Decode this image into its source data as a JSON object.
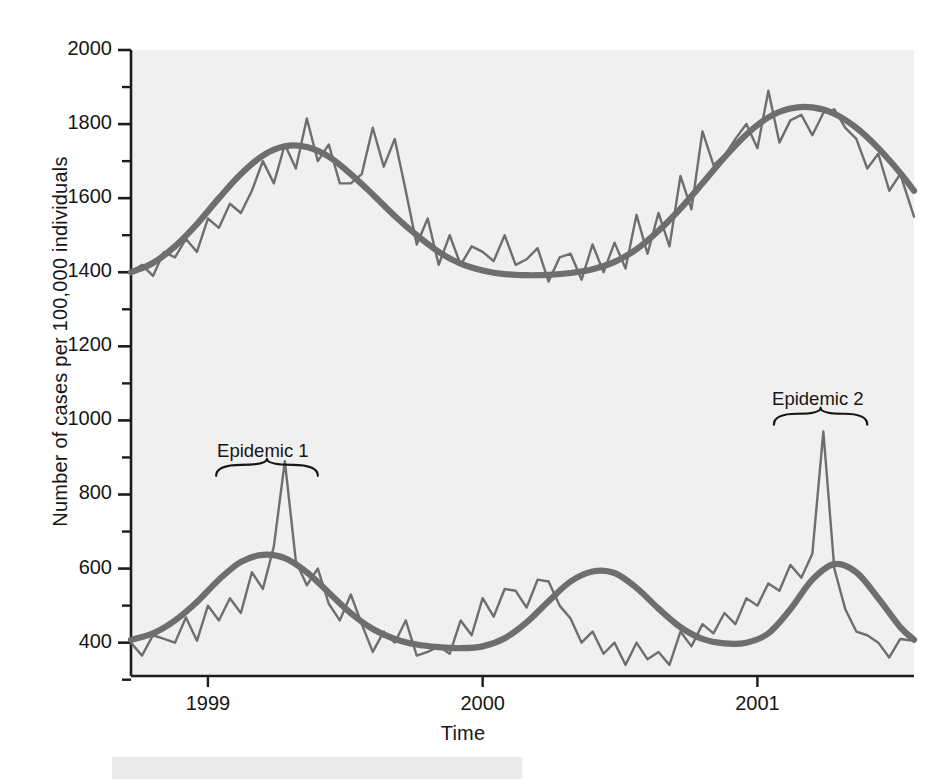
{
  "figure": {
    "background_color": "#ffffff",
    "plot_background_color": "#f0f0f0",
    "line_color": "#6e6e6e",
    "axis_color": "#1c1c1c",
    "text_color": "#161616"
  },
  "chart_data": {
    "type": "line",
    "title": "",
    "xlabel": "Time",
    "ylabel": "Number of cases per 100,000 individuals",
    "xlim": [
      1998.72,
      2001.57
    ],
    "ylim": [
      310,
      2000
    ],
    "grid": false,
    "legend": null,
    "y_major_ticks": [
      400,
      600,
      800,
      1000,
      1200,
      1400,
      1600,
      1800,
      2000
    ],
    "y_minor_ticks": [
      300,
      500,
      700,
      900,
      1100,
      1300,
      1500,
      1700,
      1900
    ],
    "y_tick_labels": [
      "400",
      "600",
      "800",
      "1000",
      "1200",
      "1400",
      "1600",
      "1800",
      "2000"
    ],
    "x_ticks": [
      1999,
      2000,
      2001
    ],
    "x_tick_labels": [
      "1999",
      "2000",
      "2001"
    ],
    "annotations": [
      {
        "label": "Epidemic 1",
        "x": 1999.2,
        "y_text": 915,
        "brace_left": 1999.03,
        "brace_right": 1999.4,
        "brace_y": 880
      },
      {
        "label": "Epidemic 2",
        "x": 2001.22,
        "y_text": 1055,
        "brace_left": 2001.06,
        "brace_right": 2001.4,
        "brace_y": 1018
      }
    ],
    "series": [
      {
        "name": "upper-observed",
        "role": "noisy-observed",
        "style": "thin-line",
        "x": [
          1998.72,
          1998.76,
          1998.8,
          1998.84,
          1998.88,
          1998.92,
          1998.96,
          1999.0,
          1999.04,
          1999.08,
          1999.12,
          1999.16,
          1999.2,
          1999.24,
          1999.28,
          1999.32,
          1999.36,
          1999.4,
          1999.44,
          1999.48,
          1999.52,
          1999.56,
          1999.6,
          1999.64,
          1999.68,
          1999.72,
          1999.76,
          1999.8,
          1999.84,
          1999.88,
          1999.92,
          1999.96,
          2000.0,
          2000.04,
          2000.08,
          2000.12,
          2000.16,
          2000.2,
          2000.24,
          2000.28,
          2000.32,
          2000.36,
          2000.4,
          2000.44,
          2000.48,
          2000.52,
          2000.56,
          2000.6,
          2000.64,
          2000.68,
          2000.72,
          2000.76,
          2000.8,
          2000.84,
          2000.88,
          2000.92,
          2000.96,
          2001.0,
          2001.04,
          2001.08,
          2001.12,
          2001.16,
          2001.2,
          2001.24,
          2001.28,
          2001.32,
          2001.36,
          2001.4,
          2001.44,
          2001.48,
          2001.52,
          2001.57
        ],
        "values": [
          1400,
          1420,
          1390,
          1455,
          1440,
          1490,
          1455,
          1545,
          1520,
          1585,
          1560,
          1620,
          1700,
          1640,
          1745,
          1680,
          1815,
          1700,
          1745,
          1640,
          1640,
          1665,
          1790,
          1685,
          1760,
          1620,
          1475,
          1545,
          1420,
          1500,
          1420,
          1470,
          1455,
          1430,
          1500,
          1420,
          1435,
          1465,
          1375,
          1440,
          1450,
          1380,
          1475,
          1400,
          1480,
          1410,
          1555,
          1450,
          1560,
          1470,
          1660,
          1570,
          1780,
          1690,
          1715,
          1760,
          1800,
          1735,
          1890,
          1750,
          1810,
          1825,
          1770,
          1830,
          1840,
          1790,
          1760,
          1680,
          1720,
          1620,
          1665,
          1550
        ]
      },
      {
        "name": "upper-trend",
        "role": "smooth-trend",
        "style": "thick-line",
        "x": [
          1998.72,
          1998.8,
          1998.88,
          1998.96,
          1999.04,
          1999.12,
          1999.2,
          1999.28,
          1999.36,
          1999.44,
          1999.52,
          1999.6,
          1999.68,
          1999.76,
          1999.84,
          1999.92,
          2000.0,
          2000.08,
          2000.16,
          2000.24,
          2000.32,
          2000.4,
          2000.48,
          2000.56,
          2000.64,
          2000.72,
          2000.8,
          2000.88,
          2000.96,
          2001.04,
          2001.12,
          2001.2,
          2001.28,
          2001.36,
          2001.44,
          2001.52,
          2001.57
        ],
        "values": [
          1400,
          1425,
          1470,
          1530,
          1600,
          1665,
          1715,
          1740,
          1738,
          1712,
          1665,
          1610,
          1552,
          1500,
          1455,
          1423,
          1405,
          1395,
          1392,
          1393,
          1398,
          1408,
          1428,
          1462,
          1512,
          1572,
          1640,
          1710,
          1772,
          1818,
          1842,
          1845,
          1828,
          1790,
          1735,
          1668,
          1620
        ]
      },
      {
        "name": "lower-observed",
        "role": "noisy-observed",
        "style": "thin-line",
        "x": [
          1998.72,
          1998.76,
          1998.8,
          1998.84,
          1998.88,
          1998.92,
          1998.96,
          1999.0,
          1999.04,
          1999.08,
          1999.12,
          1999.16,
          1999.2,
          1999.24,
          1999.28,
          1999.32,
          1999.36,
          1999.4,
          1999.44,
          1999.48,
          1999.52,
          1999.56,
          1999.6,
          1999.64,
          1999.68,
          1999.72,
          1999.76,
          1999.8,
          1999.84,
          1999.88,
          1999.92,
          1999.96,
          2000.0,
          2000.04,
          2000.08,
          2000.12,
          2000.16,
          2000.2,
          2000.24,
          2000.28,
          2000.32,
          2000.36,
          2000.4,
          2000.44,
          2000.48,
          2000.52,
          2000.56,
          2000.6,
          2000.64,
          2000.68,
          2000.72,
          2000.76,
          2000.8,
          2000.84,
          2000.88,
          2000.92,
          2000.96,
          2001.0,
          2001.04,
          2001.08,
          2001.12,
          2001.16,
          2001.2,
          2001.24,
          2001.28,
          2001.32,
          2001.36,
          2001.4,
          2001.44,
          2001.48,
          2001.52,
          2001.57
        ],
        "values": [
          400,
          365,
          420,
          410,
          400,
          468,
          405,
          500,
          460,
          520,
          480,
          590,
          545,
          660,
          890,
          620,
          555,
          600,
          505,
          460,
          530,
          450,
          375,
          430,
          400,
          460,
          365,
          375,
          390,
          370,
          460,
          420,
          520,
          470,
          545,
          540,
          495,
          570,
          565,
          500,
          465,
          400,
          430,
          370,
          400,
          340,
          400,
          355,
          375,
          340,
          430,
          390,
          450,
          425,
          480,
          450,
          520,
          500,
          560,
          540,
          610,
          575,
          640,
          970,
          600,
          490,
          430,
          420,
          400,
          360,
          410,
          405
        ]
      },
      {
        "name": "lower-trend",
        "role": "smooth-trend",
        "style": "thick-line",
        "x": [
          1998.72,
          1998.8,
          1998.88,
          1998.96,
          1999.04,
          1999.12,
          1999.2,
          1999.28,
          1999.36,
          1999.44,
          1999.52,
          1999.6,
          1999.68,
          1999.76,
          1999.84,
          1999.92,
          2000.0,
          2000.08,
          2000.16,
          2000.24,
          2000.32,
          2000.4,
          2000.48,
          2000.56,
          2000.64,
          2000.72,
          2000.8,
          2000.88,
          2000.96,
          2001.04,
          2001.12,
          2001.2,
          2001.28,
          2001.36,
          2001.44,
          2001.52,
          2001.57
        ],
        "values": [
          408,
          425,
          460,
          510,
          570,
          618,
          637,
          628,
          590,
          535,
          480,
          437,
          410,
          395,
          388,
          385,
          390,
          412,
          455,
          512,
          565,
          592,
          588,
          548,
          492,
          442,
          410,
          398,
          400,
          425,
          490,
          570,
          612,
          590,
          520,
          442,
          408
        ]
      }
    ]
  }
}
